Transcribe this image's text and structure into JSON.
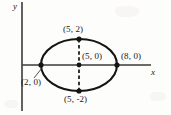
{
  "figure": {
    "kind": "ellipse-diagram",
    "axes": {
      "x_label": "x",
      "y_label": "y",
      "x_axis_pixel_y": 65,
      "y_axis_pixel_x": 22
    },
    "ellipse": {
      "center_label": "(5, 0)",
      "center_x": 5,
      "center_y": 0,
      "semi_major_a": 3,
      "semi_minor_b": 2,
      "px_center_x": 79,
      "px_center_y": 65,
      "px_rx": 38,
      "px_ry": 26,
      "stroke": "#141414"
    },
    "points": [
      {
        "label": "(5, 2)",
        "x": 5,
        "y": 2,
        "px_x": 79,
        "px_y": 39,
        "name": "top-vertex"
      },
      {
        "label": "(5, 0)",
        "x": 5,
        "y": 0,
        "px_x": 79,
        "px_y": 65,
        "name": "center-point"
      },
      {
        "label": "(8, 0)",
        "x": 8,
        "y": 0,
        "px_x": 117,
        "px_y": 65,
        "name": "right-vertex"
      },
      {
        "label": "(2, 0)",
        "x": 2,
        "y": 0,
        "px_x": 41,
        "px_y": 65,
        "name": "left-vertex"
      },
      {
        "label": "(5, -2)",
        "x": 5,
        "y": -2,
        "px_x": 79,
        "px_y": 91,
        "name": "bottom-vertex"
      }
    ],
    "minor_axis_segment": {
      "style": "dashed",
      "from_label": "(5, 2)",
      "to_label": "(5, -2)"
    },
    "leader_line": {
      "from_label": "(2, 0)",
      "note": "thin pointer from (2, 0) text up-right to left vertex dot"
    },
    "colors": {
      "ink": "#141414",
      "axis": "#3a3a3a",
      "paper": "#fdfdfc"
    }
  }
}
